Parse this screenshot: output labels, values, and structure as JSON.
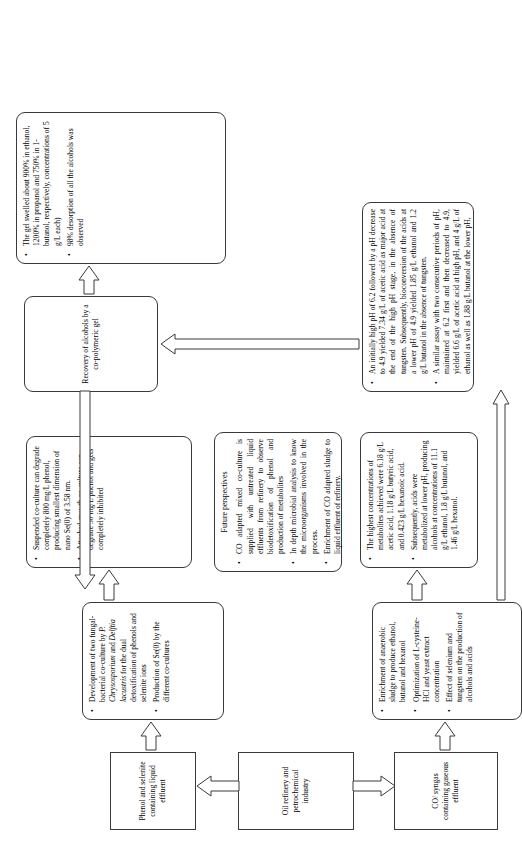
{
  "diagram": {
    "orientation": "landscape artwork rotated 90 degrees counter-clockwise",
    "background_color": "#ffffff",
    "line_color": "#3a3a3a"
  },
  "boxes": {
    "phenol_selenite_source": {
      "name": "Phenol and selenite containing liquid effluent",
      "lines": [
        "Phenol and selenite",
        "containing liquid",
        "effluent"
      ],
      "shape": "rectangle"
    },
    "oil_refinery_source": {
      "name": "Oil refinery and petrochemical industry",
      "lines": [
        "Oil refinery and",
        "petrochemical industry"
      ],
      "shape": "rectangle"
    },
    "co_syngas_source": {
      "name": "CO/ syngas containing gaseous effluent",
      "lines": [
        "CO/ syngas containing gaseous",
        "effluent"
      ],
      "shape": "rectangle"
    },
    "co_culture_development": {
      "shape": "rounded-rectangle",
      "bullets": [
        "Development of two fungal-bacterial co-culture by <i>P. Chrysosporium</i> and <i>Delftia lacustris</i> for the dual detoxification of phenols and selenite ions",
        "Production of Se(0) by the different co-cultures"
      ]
    },
    "co_culture_results": {
      "shape": "rounded-rectangle",
      "bullets": [
        "Suspended co-culture can degrade completely 800 mg/L phenol, producing smallest dimension of nano Se(0) of 3.58 nm.",
        "Attached growth co-culture can degrade 50 mg/L phenol and gets completely inhibited"
      ]
    },
    "future_perspectives": {
      "shape": "rounded-rectangle",
      "heading": "Future perspectives",
      "bullets": [
        "CO adapted mixed co-culture is supplied with untreated liquid effluents from refinery to observe biodetoxification of phenol and production of metabolites",
        "In depth microbial analysis to know the microorganisms involved in the process.",
        "Enrichment of CO adapted sludge to liquid effluent of refinery."
      ]
    },
    "sludge_enrichment": {
      "shape": "rounded-rectangle",
      "bullets": [
        "Enrichment of anaerobic sludge to produce ethanol, butanol and hexanol",
        "Optimization of L-cysteine-HCl and yeast extract concentration",
        "Effect of selenium and tungsten on the production of alcohols and acids"
      ]
    },
    "metabolite_concentrations": {
      "shape": "rounded-rectangle",
      "bullets": [
        "The highest concentrations of metabolites achieved were 6.18 g/L acetic acid, 1.18 g/L butyric acid, and 0.423 g/L hexanoic acid.",
        "Subsequently, acids were metabolized at lower pH, producing alcohols at concentrations of 11.1 g/L ethanol, 1.8 g/L butanol, and 1.46 g/L hexanol."
      ]
    },
    "ph_assay_results": {
      "shape": "rounded-rectangle",
      "bullets": [
        "An initially high pH of 6.2 followed by a pH decrease to 4.9 yielded 7.34 g/L of acetic acid as major acid at the end of the high pH stage, in the absence of tungsten. Subsequently, bioconversion of the acids at a lower pH of 4.9 yielded 1.85 g/L ethanol and 1.2 g/L butanol in the absence of tungsten.",
        "A similar assay with two consecutive periods of pH, maintained at 6.2 first and then decreased to 4.9, yielded 6.6 g/L of acetic acid at high pH, and 4 g/L of ethanol as well as 1.88 g/L butanol at the lower pH,"
      ]
    },
    "alcohol_recovery": {
      "shape": "rounded-rectangle",
      "lines": [
        "Recovery of alcohols by a",
        "co-polymeric gel"
      ]
    },
    "gel_results": {
      "shape": "rounded-rectangle",
      "bullets": [
        "The gel swelled about 900% in ethanol, 1200% in propanol and 750% in 1-butanol, respectively, concentrations of 5 g/L each)",
        "98% desorption of all the alcohols was observed"
      ]
    }
  },
  "arrows": [
    {
      "name": "arrow-oil-refinery-to-phenol-effluent",
      "from": "oil_refinery_source",
      "to": "phenol_selenite_source"
    },
    {
      "name": "arrow-phenol-effluent-to-co-culture-development",
      "from": "phenol_selenite_source",
      "to": "co_culture_development"
    },
    {
      "name": "arrow-co-culture-development-to-results",
      "from": "co_culture_development",
      "to": "co_culture_results"
    },
    {
      "name": "arrow-oil-refinery-to-co-syngas",
      "from": "oil_refinery_source",
      "to": "co_syngas_source"
    },
    {
      "name": "arrow-co-syngas-to-sludge-enrichment",
      "from": "co_syngas_source",
      "to": "sludge_enrichment"
    },
    {
      "name": "arrow-sludge-enrichment-to-metabolites",
      "from": "sludge_enrichment",
      "to": "metabolite_concentrations"
    },
    {
      "name": "arrow-sludge-enrichment-to-ph-assay",
      "from": "sludge_enrichment",
      "to": "ph_assay_results"
    },
    {
      "name": "arrow-metabolites-to-alcohol-recovery",
      "from": "metabolite_concentrations",
      "to": "alcohol_recovery"
    },
    {
      "name": "arrow-alcohol-recovery-to-gel-results",
      "from": "alcohol_recovery",
      "to": "gel_results"
    },
    {
      "name": "arrow-alcohol-recovery-to-future-perspectives",
      "from": "alcohol_recovery",
      "to": "future_perspectives"
    }
  ]
}
